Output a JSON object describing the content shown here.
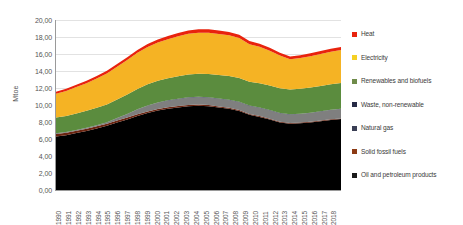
{
  "chart_data": {
    "type": "area",
    "title": "",
    "xlabel": "",
    "ylabel": "Mtoe",
    "ylim": [
      0,
      20
    ],
    "ytick_labels": [
      "20,00",
      "18,00",
      "16,00",
      "14,00",
      "12,00",
      "10,00",
      "8,00",
      "6,00",
      "4,00",
      "2,00",
      "0,00"
    ],
    "ytick_values": [
      20,
      18,
      16,
      14,
      12,
      10,
      8,
      6,
      4,
      2,
      0
    ],
    "grid": true,
    "legend_position": "right",
    "stacked": true,
    "categories": [
      "1990",
      "1991",
      "1992",
      "1993",
      "1994",
      "1995",
      "1996",
      "1997",
      "1998",
      "1999",
      "2000",
      "2001",
      "2002",
      "2003",
      "2004",
      "2005",
      "2006",
      "2007",
      "2008",
      "2009",
      "2010",
      "2011",
      "2012",
      "2013",
      "2014",
      "2015",
      "2016",
      "2017",
      "2018"
    ],
    "series": [
      {
        "name": "Oil and petroleum products",
        "color": "#000000",
        "values": [
          6.3,
          6.45,
          6.7,
          6.95,
          7.25,
          7.55,
          7.95,
          8.3,
          8.7,
          9.05,
          9.35,
          9.55,
          9.7,
          9.85,
          9.9,
          9.85,
          9.7,
          9.55,
          9.3,
          8.85,
          8.6,
          8.3,
          7.95,
          7.8,
          7.85,
          7.95,
          8.1,
          8.25,
          8.35
        ]
      },
      {
        "name": "Solid fossil fuels",
        "color": "#6b2410",
        "values": [
          0.3,
          0.28,
          0.27,
          0.26,
          0.25,
          0.24,
          0.23,
          0.22,
          0.21,
          0.2,
          0.19,
          0.18,
          0.17,
          0.16,
          0.15,
          0.14,
          0.13,
          0.12,
          0.11,
          0.1,
          0.1,
          0.09,
          0.09,
          0.08,
          0.08,
          0.08,
          0.07,
          0.07,
          0.07
        ]
      },
      {
        "name": "Natural gas",
        "color": "#7f7f7f",
        "values": [
          0.05,
          0.06,
          0.07,
          0.08,
          0.1,
          0.15,
          0.25,
          0.4,
          0.55,
          0.65,
          0.72,
          0.78,
          0.82,
          0.85,
          0.86,
          0.87,
          0.88,
          0.9,
          0.92,
          0.93,
          0.95,
          0.96,
          0.97,
          0.98,
          1.0,
          1.02,
          1.05,
          1.08,
          1.1
        ]
      },
      {
        "name": "Waste, non-renewable",
        "color": "#262a45",
        "values": [
          0.02,
          0.02,
          0.02,
          0.02,
          0.02,
          0.02,
          0.03,
          0.03,
          0.03,
          0.03,
          0.04,
          0.04,
          0.04,
          0.04,
          0.05,
          0.05,
          0.05,
          0.05,
          0.05,
          0.05,
          0.05,
          0.05,
          0.05,
          0.05,
          0.05,
          0.05,
          0.05,
          0.05,
          0.05
        ]
      },
      {
        "name": "Renewables and biofuels",
        "color": "#5b8c3e",
        "values": [
          1.85,
          1.9,
          1.95,
          2.0,
          2.05,
          2.1,
          2.2,
          2.3,
          2.4,
          2.5,
          2.55,
          2.6,
          2.65,
          2.7,
          2.72,
          2.74,
          2.76,
          2.78,
          2.8,
          2.82,
          2.85,
          2.88,
          2.9,
          2.92,
          2.94,
          2.96,
          2.98,
          3.0,
          3.02
        ]
      },
      {
        "name": "Electricity",
        "color": "#f5b324",
        "values": [
          2.8,
          2.95,
          3.1,
          3.25,
          3.45,
          3.65,
          3.85,
          4.05,
          4.25,
          4.4,
          4.5,
          4.6,
          4.7,
          4.78,
          4.82,
          4.86,
          4.84,
          4.8,
          4.7,
          4.4,
          4.3,
          4.1,
          3.85,
          3.55,
          3.6,
          3.68,
          3.75,
          3.82,
          3.88
        ]
      },
      {
        "name": "Heat",
        "color": "#e8230d",
        "values": [
          0.25,
          0.26,
          0.27,
          0.28,
          0.3,
          0.31,
          0.32,
          0.33,
          0.34,
          0.35,
          0.36,
          0.37,
          0.38,
          0.39,
          0.4,
          0.41,
          0.4,
          0.4,
          0.39,
          0.38,
          0.37,
          0.36,
          0.35,
          0.34,
          0.34,
          0.34,
          0.35,
          0.35,
          0.35
        ]
      }
    ],
    "totals": [
      11.57,
      11.92,
      12.38,
      12.84,
      13.42,
      14.02,
      14.83,
      15.63,
      16.48,
      17.18,
      17.71,
      18.17,
      18.46,
      18.77,
      18.9,
      18.92,
      18.76,
      18.6,
      18.27,
      17.53,
      17.22,
      16.74,
      16.16,
      15.72,
      15.86,
      16.08,
      16.4,
      16.62,
      16.82
    ]
  },
  "legend": {
    "items": [
      {
        "label": "Heat",
        "color": "#e8230d"
      },
      {
        "label": "Electricity",
        "color": "#f5d024"
      },
      {
        "label": "Renewables and biofuels",
        "color": "#6f8b4a"
      },
      {
        "label": "Waste, non-renewable",
        "color": "#262a45"
      },
      {
        "label": "Natural gas",
        "color": "#3a3f55"
      },
      {
        "label": "Solid fossil fuels",
        "color": "#8c3a14"
      },
      {
        "label": "Oil and petroleum products",
        "color": "#1a1a1a"
      }
    ]
  }
}
